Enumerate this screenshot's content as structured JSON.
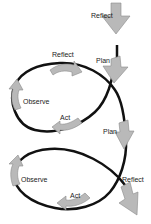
{
  "diagram": {
    "colors": {
      "line": "#111111",
      "arrow_fill": "#b9b9b9",
      "arrow_stroke": "#8a8a8a"
    },
    "labels": {
      "reflect_top": "Reflect",
      "plan_1": "Plan",
      "reflect_1": "Reflect",
      "observe_1": "Observe",
      "act_1": "Act",
      "plan_2": "Plan",
      "observe_2": "Observe",
      "act_2": "Act",
      "reflect_2": "Reflect"
    }
  }
}
